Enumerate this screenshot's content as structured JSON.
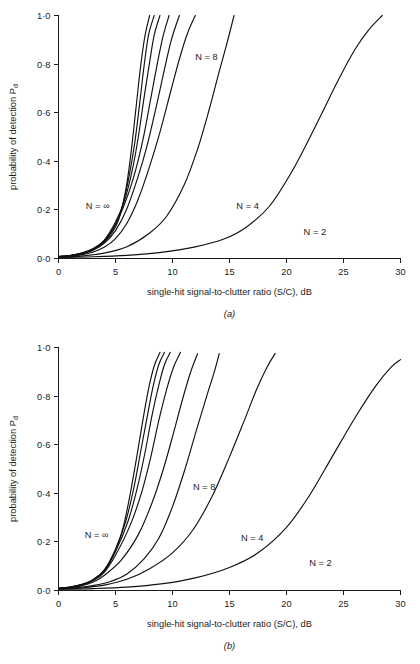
{
  "figure": {
    "background_color": "#ffffff",
    "line_color": "#111111",
    "text_color": "#1b1b1b"
  },
  "panel_a": {
    "caption": "(a)",
    "xlabel": "single-hit signal-to-clutter ratio (S/C), dB",
    "ylabel_main": "probability of detection P",
    "ylabel_sub": "d",
    "x_ticks": [
      "0",
      "5",
      "10",
      "15",
      "20",
      "25",
      "30"
    ],
    "y_ticks": [
      "1·0",
      "0·8",
      "0·6",
      "0·4",
      "0·2",
      "0·0"
    ],
    "curve_labels": [
      {
        "text": "N = ∞",
        "x": 2.4,
        "y": 0.205
      },
      {
        "text": "N = 8",
        "x": 12.0,
        "y": 0.815
      },
      {
        "text": "N = 4",
        "x": 15.6,
        "y": 0.205
      },
      {
        "text": "N = 2",
        "x": 21.5,
        "y": 0.095
      }
    ]
  },
  "panel_b": {
    "caption": "(b)",
    "xlabel": "single-hit signal-to-clutter ratio (S/C), dB",
    "ylabel_main": "probability of detection P",
    "ylabel_sub": "d",
    "x_ticks": [
      "0",
      "5",
      "10",
      "15",
      "20",
      "25",
      "30"
    ],
    "y_ticks": [
      "1·0",
      "0·8",
      "0·6",
      "0·4",
      "0·2",
      "0·0"
    ],
    "curve_labels": [
      {
        "text": "N = ∞",
        "x": 2.3,
        "y": 0.215
      },
      {
        "text": "N = 8",
        "x": 11.8,
        "y": 0.415
      },
      {
        "text": "N = 4",
        "x": 16.0,
        "y": 0.205
      },
      {
        "text": "N = 2",
        "x": 22.0,
        "y": 0.1
      }
    ]
  },
  "chart_data": {
    "type": "line",
    "title": "",
    "subtitle": "",
    "panels": [
      {
        "id": "a",
        "caption": "(a)",
        "xlabel": "single-hit signal-to-clutter ratio (S/C), dB",
        "ylabel": "probability of detection Pd",
        "xlim": [
          0,
          30
        ],
        "ylim": [
          0.0,
          1.0
        ],
        "xticks": [
          0,
          5,
          10,
          15,
          20,
          25,
          30
        ],
        "yticks": [
          0.0,
          0.2,
          0.4,
          0.6,
          0.8,
          1.0
        ],
        "grid": false,
        "legend": "inline-curve-labels",
        "series": [
          {
            "name": "N = ∞",
            "x": [
              0.0,
              1.0,
              2.0,
              3.0,
              4.0,
              5.0,
              5.5,
              6.0,
              6.4,
              6.8,
              7.2,
              7.6,
              8.0
            ],
            "values": [
              0.008,
              0.012,
              0.02,
              0.035,
              0.065,
              0.13,
              0.195,
              0.31,
              0.45,
              0.62,
              0.79,
              0.92,
              1.0
            ]
          },
          {
            "name": "N = 64",
            "x": [
              0.0,
              1.0,
              2.0,
              3.0,
              4.0,
              5.0,
              5.6,
              6.2,
              6.7,
              7.1,
              7.5,
              7.9,
              8.4
            ],
            "values": [
              0.008,
              0.012,
              0.021,
              0.038,
              0.07,
              0.14,
              0.215,
              0.34,
              0.48,
              0.63,
              0.79,
              0.92,
              1.0
            ]
          },
          {
            "name": "N = 32",
            "x": [
              0.0,
              1.0,
              2.0,
              3.0,
              4.0,
              5.0,
              5.8,
              6.5,
              7.0,
              7.5,
              8.0,
              8.4,
              8.9
            ],
            "values": [
              0.008,
              0.012,
              0.022,
              0.04,
              0.075,
              0.15,
              0.24,
              0.37,
              0.5,
              0.66,
              0.81,
              0.92,
              1.0
            ]
          },
          {
            "name": "N = 16",
            "x": [
              0.0,
              1.0,
              2.0,
              3.0,
              4.0,
              5.0,
              6.0,
              6.8,
              7.5,
              8.1,
              8.7,
              9.2,
              9.7
            ],
            "values": [
              0.007,
              0.011,
              0.02,
              0.038,
              0.072,
              0.14,
              0.25,
              0.37,
              0.51,
              0.66,
              0.81,
              0.92,
              1.0
            ]
          },
          {
            "name": "N = 10",
            "x": [
              0.0,
              1.0,
              2.0,
              3.0,
              4.0,
              5.0,
              6.0,
              7.0,
              7.8,
              8.6,
              9.3,
              9.9,
              10.6
            ],
            "values": [
              0.007,
              0.01,
              0.018,
              0.033,
              0.062,
              0.115,
              0.205,
              0.34,
              0.47,
              0.63,
              0.78,
              0.9,
              1.0
            ]
          },
          {
            "name": "N = 8",
            "x": [
              0.0,
              1.0,
              2.0,
              3.0,
              4.0,
              5.0,
              6.0,
              7.0,
              8.0,
              8.9,
              9.8,
              10.6,
              11.3,
              12.0
            ],
            "values": [
              0.006,
              0.009,
              0.015,
              0.026,
              0.046,
              0.082,
              0.145,
              0.245,
              0.38,
              0.52,
              0.68,
              0.82,
              0.925,
              1.0
            ]
          },
          {
            "name": "N = 4",
            "x": [
              0.0,
              2.0,
              4.0,
              6.0,
              8.0,
              9.5,
              11.0,
              12.2,
              13.2,
              14.1,
              14.8,
              15.4
            ],
            "values": [
              0.005,
              0.01,
              0.022,
              0.048,
              0.105,
              0.175,
              0.3,
              0.45,
              0.61,
              0.77,
              0.89,
              1.0
            ]
          },
          {
            "name": "N = 2",
            "x": [
              0.0,
              3.0,
              6.0,
              9.0,
              12.0,
              14.5,
              16.5,
              18.5,
              20.5,
              22.5,
              24.5,
              26.0,
              27.2,
              28.4
            ],
            "values": [
              0.004,
              0.007,
              0.013,
              0.025,
              0.048,
              0.08,
              0.13,
              0.215,
              0.36,
              0.54,
              0.73,
              0.86,
              0.94,
              1.0
            ]
          }
        ],
        "annotations": [
          {
            "text": "N = ∞",
            "x": 2.4,
            "y": 0.205
          },
          {
            "text": "N = 8",
            "x": 12.0,
            "y": 0.815
          },
          {
            "text": "N = 4",
            "x": 15.6,
            "y": 0.205
          },
          {
            "text": "N = 2",
            "x": 21.5,
            "y": 0.095
          }
        ]
      },
      {
        "id": "b",
        "caption": "(b)",
        "xlabel": "single-hit signal-to-clutter ratio (S/C), dB",
        "ylabel": "probability of detection Pd",
        "xlim": [
          0,
          30
        ],
        "ylim": [
          0.0,
          1.0
        ],
        "xticks": [
          0,
          5,
          10,
          15,
          20,
          25,
          30
        ],
        "yticks": [
          0.0,
          0.2,
          0.4,
          0.6,
          0.8,
          1.0
        ],
        "grid": false,
        "legend": "inline-curve-labels",
        "series": [
          {
            "name": "N = ∞",
            "x": [
              0.0,
              1.0,
              2.0,
              3.0,
              4.0,
              5.0,
              5.7,
              6.3,
              6.9,
              7.4,
              7.9,
              8.4,
              8.9
            ],
            "values": [
              0.009,
              0.014,
              0.024,
              0.042,
              0.08,
              0.165,
              0.265,
              0.4,
              0.56,
              0.7,
              0.83,
              0.925,
              0.98
            ]
          },
          {
            "name": "N = 64",
            "x": [
              0.0,
              1.0,
              2.0,
              3.0,
              4.0,
              5.0,
              5.9,
              6.6,
              7.2,
              7.8,
              8.3,
              8.8,
              9.3
            ],
            "values": [
              0.009,
              0.014,
              0.024,
              0.044,
              0.084,
              0.17,
              0.285,
              0.42,
              0.57,
              0.72,
              0.84,
              0.93,
              0.98
            ]
          },
          {
            "name": "N = 32",
            "x": [
              0.0,
              1.0,
              2.0,
              3.0,
              4.0,
              5.0,
              6.1,
              6.9,
              7.6,
              8.2,
              8.8,
              9.3,
              9.8
            ],
            "values": [
              0.009,
              0.013,
              0.023,
              0.042,
              0.08,
              0.16,
              0.285,
              0.42,
              0.57,
              0.72,
              0.845,
              0.93,
              0.98
            ]
          },
          {
            "name": "N = 16",
            "x": [
              0.0,
              1.0,
              2.0,
              3.0,
              4.0,
              5.0,
              6.3,
              7.3,
              8.1,
              8.8,
              9.5,
              10.1,
              10.7
            ],
            "values": [
              0.008,
              0.012,
              0.022,
              0.04,
              0.074,
              0.145,
              0.27,
              0.405,
              0.55,
              0.7,
              0.83,
              0.92,
              0.98
            ]
          },
          {
            "name": "N = 10",
            "x": [
              0.0,
              1.0,
              2.0,
              3.0,
              4.0,
              5.5,
              7.0,
              8.2,
              9.2,
              10.1,
              10.9,
              11.6,
              12.2
            ],
            "values": [
              0.008,
              0.011,
              0.019,
              0.034,
              0.062,
              0.125,
              0.23,
              0.36,
              0.5,
              0.65,
              0.79,
              0.9,
              0.975
            ]
          },
          {
            "name": "N = 8",
            "x": [
              0.0,
              1.5,
              3.0,
              4.5,
              6.0,
              7.5,
              8.8,
              10.0,
              11.1,
              12.1,
              13.0,
              13.7,
              14.1
            ],
            "values": [
              0.007,
              0.011,
              0.02,
              0.036,
              0.068,
              0.13,
              0.215,
              0.345,
              0.5,
              0.66,
              0.8,
              0.905,
              0.975
            ]
          },
          {
            "name": "N = 4",
            "x": [
              0.0,
              2.0,
              4.0,
              6.0,
              8.0,
              10.0,
              11.8,
              13.5,
              15.0,
              16.3,
              17.4,
              18.3,
              19.0
            ],
            "values": [
              0.006,
              0.011,
              0.022,
              0.046,
              0.09,
              0.155,
              0.25,
              0.39,
              0.55,
              0.7,
              0.83,
              0.92,
              0.975
            ]
          },
          {
            "name": "N = 2",
            "x": [
              0.0,
              3.0,
              6.0,
              9.0,
              12.0,
              15.0,
              17.5,
              20.0,
              22.0,
              24.0,
              26.0,
              27.8,
              29.2,
              30.0
            ],
            "values": [
              0.005,
              0.008,
              0.014,
              0.027,
              0.052,
              0.095,
              0.155,
              0.26,
              0.39,
              0.55,
              0.71,
              0.84,
              0.92,
              0.95
            ]
          }
        ],
        "annotations": [
          {
            "text": "N = ∞",
            "x": 2.3,
            "y": 0.215
          },
          {
            "text": "N = 8",
            "x": 11.8,
            "y": 0.415
          },
          {
            "text": "N = 4",
            "x": 16.0,
            "y": 0.205
          },
          {
            "text": "N = 2",
            "x": 22.0,
            "y": 0.1
          }
        ]
      }
    ]
  }
}
